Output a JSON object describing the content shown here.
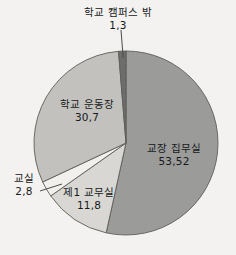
{
  "chart_data": {
    "type": "pie",
    "title": "",
    "subtitle": "",
    "xlabel": "",
    "ylabel": "",
    "legend_position": "none",
    "grid": false,
    "decimal_separator": ",",
    "start_angle_deg": 0,
    "direction": "clockwise",
    "categories": [
      "교장 집무실",
      "제1 교무실",
      "교실",
      "학교 운동장",
      "학교 캠퍼스 밖"
    ],
    "values": [
      53.52,
      11.8,
      2.8,
      30.7,
      1.3
    ],
    "value_labels": [
      "53,52",
      "11,8",
      "2,8",
      "30,7",
      "1,3"
    ],
    "slices": [
      {
        "label": "교장 집무실",
        "value": 53.52,
        "value_label": "53,52",
        "color": "#9b9b99",
        "leader_line": false
      },
      {
        "label": "제1 교무실",
        "value": 11.8,
        "value_label": "11,8",
        "color": "#d9d8d4",
        "leader_line": false
      },
      {
        "label": "교실",
        "value": 2.8,
        "value_label": "2,8",
        "color": "#f2f1ee",
        "leader_line": true
      },
      {
        "label": "학교 운동장",
        "value": 30.7,
        "value_label": "30,7",
        "color": "#c3c2be",
        "leader_line": false
      },
      {
        "label": "학교 캠퍼스 밖",
        "value": 1.3,
        "value_label": "1,3",
        "color": "#6d6d6b",
        "leader_line": true
      }
    ],
    "colors": {
      "background": "#f4f3f1",
      "outline": "#5c5c5a",
      "text": "#16181a",
      "leader_line": "#4a4a48"
    }
  }
}
